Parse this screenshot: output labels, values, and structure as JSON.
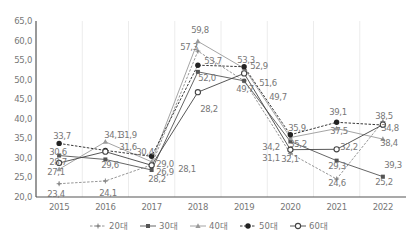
{
  "chart_data": {
    "type": "line",
    "title": "",
    "xlabel": "",
    "ylabel": "",
    "ylim": [
      20.0,
      65.0
    ],
    "yticks": [
      "20,0",
      "25,0",
      "30,0",
      "35,0",
      "40,0",
      "45,0",
      "50,0",
      "55,0",
      "60,0",
      "65,0"
    ],
    "categories": [
      "2015",
      "2016",
      "2017",
      "2018",
      "2019",
      "2020",
      "2021",
      "2022"
    ],
    "grid": "vertical",
    "legend_position": "bottom",
    "series": [
      {
        "name": "20대",
        "style": "dashed",
        "marker": "plus",
        "color": "#8a8a8a",
        "values": [
          23.4,
          24.1,
          28.2,
          57.3,
          49.7,
          31.1,
          24.6,
          39.3
        ]
      },
      {
        "name": "30대",
        "style": "solid",
        "marker": "square",
        "color": "#555555",
        "values": [
          30.6,
          29.6,
          26.9,
          52.0,
          49.7,
          34.2,
          29.3,
          25.2
        ]
      },
      {
        "name": "40대",
        "style": "solid",
        "marker": "triangle",
        "color": "#9a9a9a",
        "values": [
          27.1,
          34.1,
          29.0,
          59.8,
          52.9,
          35.2,
          37.5,
          34.8
        ]
      },
      {
        "name": "50대",
        "style": "dashed",
        "marker": "circle-filled",
        "color": "#222222",
        "values": [
          33.7,
          31.9,
          30.4,
          53.7,
          53.3,
          35.9,
          39.1,
          38.4
        ]
      },
      {
        "name": "60대",
        "style": "solid",
        "marker": "circle-open",
        "color": "#444444",
        "values": [
          28.7,
          31.6,
          28.1,
          46.8,
          51.6,
          32.1,
          32.2,
          38.5
        ]
      }
    ],
    "data_labels": [
      {
        "text": "33,7",
        "x": 62,
        "y": 139
      },
      {
        "text": "30,6",
        "x": 58,
        "y": 155
      },
      {
        "text": "28,7",
        "x": 58,
        "y": 165
      },
      {
        "text": "27,1",
        "x": 56,
        "y": 175
      },
      {
        "text": "23,4",
        "x": 56,
        "y": 197
      },
      {
        "text": "34,1",
        "x": 113,
        "y": 138
      },
      {
        "text": "31,9",
        "x": 128,
        "y": 138
      },
      {
        "text": "31,6",
        "x": 128,
        "y": 150
      },
      {
        "text": "29,6",
        "x": 110,
        "y": 168
      },
      {
        "text": "24,1",
        "x": 108,
        "y": 196
      },
      {
        "text": "30,4",
        "x": 145,
        "y": 155
      },
      {
        "text": "29,0",
        "x": 165,
        "y": 167
      },
      {
        "text": "26,9",
        "x": 165,
        "y": 175
      },
      {
        "text": "28,2",
        "x": 157,
        "y": 182
      },
      {
        "text": "28,1",
        "x": 187,
        "y": 172
      },
      {
        "text": "59,8",
        "x": 200,
        "y": 33
      },
      {
        "text": "57,3",
        "x": 189,
        "y": 50
      },
      {
        "text": "53,7",
        "x": 213,
        "y": 64
      },
      {
        "text": "52,0",
        "x": 207,
        "y": 81
      },
      {
        "text": "28,2",
        "x": 209,
        "y": 112
      },
      {
        "text": "53,3",
        "x": 246,
        "y": 63
      },
      {
        "text": "52,9",
        "x": 259,
        "y": 69
      },
      {
        "text": "51,6",
        "x": 268,
        "y": 86
      },
      {
        "text": "49,7",
        "x": 245,
        "y": 92
      },
      {
        "text": "49,7",
        "x": 278,
        "y": 100
      },
      {
        "text": "35,9",
        "x": 297,
        "y": 131
      },
      {
        "text": "34,2",
        "x": 271,
        "y": 150
      },
      {
        "text": "35,2",
        "x": 298,
        "y": 147
      },
      {
        "text": "31,1",
        "x": 271,
        "y": 161
      },
      {
        "text": "32,1",
        "x": 290,
        "y": 162
      },
      {
        "text": "39,1",
        "x": 338,
        "y": 115
      },
      {
        "text": "37,5",
        "x": 339,
        "y": 134
      },
      {
        "text": "32,2",
        "x": 349,
        "y": 150
      },
      {
        "text": "29,3",
        "x": 337,
        "y": 169
      },
      {
        "text": "24,6",
        "x": 337,
        "y": 186
      },
      {
        "text": "38,5",
        "x": 384,
        "y": 119
      },
      {
        "text": "34,8",
        "x": 390,
        "y": 131
      },
      {
        "text": "38,4",
        "x": 389,
        "y": 146
      },
      {
        "text": "39,3",
        "x": 393,
        "y": 168
      },
      {
        "text": "25,2",
        "x": 384,
        "y": 185
      }
    ]
  },
  "legend": {
    "items": [
      {
        "label": "20대",
        "marker": "plus",
        "style": "dashed"
      },
      {
        "label": "30대",
        "marker": "square",
        "style": "solid"
      },
      {
        "label": "40대",
        "marker": "triangle",
        "style": "solid"
      },
      {
        "label": "50대",
        "marker": "circle-filled",
        "style": "dashed"
      },
      {
        "label": "60대",
        "marker": "circle-open",
        "style": "solid"
      }
    ]
  }
}
